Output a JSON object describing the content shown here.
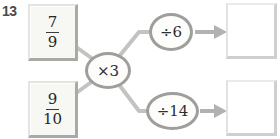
{
  "problem": {
    "number": "13",
    "start_boxes": [
      {
        "numerator": "7",
        "denominator": "9"
      },
      {
        "numerator": "9",
        "denominator": "10"
      }
    ],
    "middle_operation": "×3",
    "branch_operations": [
      {
        "label": "÷6"
      },
      {
        "label": "÷14"
      }
    ],
    "answer_boxes": [
      {
        "value": ""
      },
      {
        "value": ""
      }
    ]
  },
  "icons": {
    "arrow_top": "arrow-right-icon",
    "arrow_bottom": "arrow-right-icon"
  },
  "colors": {
    "connector_line": "#c3c3c1",
    "arrow": "#b2b2b0",
    "oval_border": "#9e9e9b",
    "box_shadow": "#a9a9a6",
    "math_text": "#2e2e2e",
    "question_number": "#4a4a4a",
    "background": "#ffffff"
  }
}
